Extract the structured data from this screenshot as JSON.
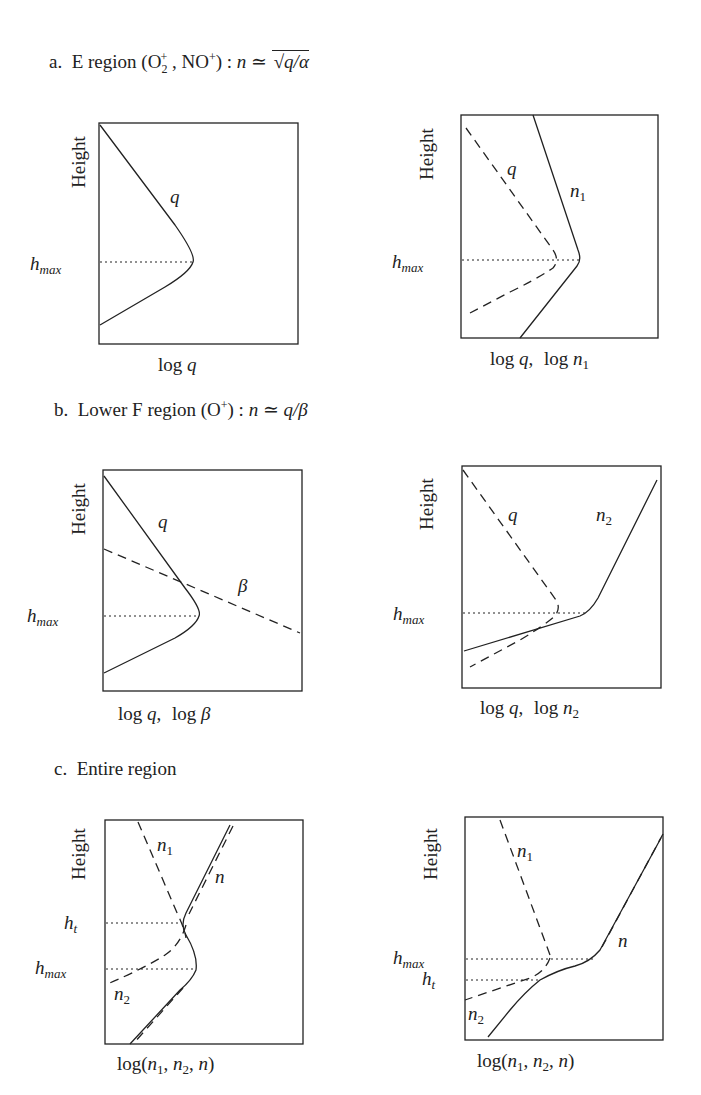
{
  "sections": [
    {
      "id": "a",
      "prefix": "a.",
      "title": "E region (O",
      "ion1_sub": "2",
      "ion1_sup": "+",
      "ion2": " , NO",
      "ion2_sup": "+",
      "formula_lead": ") : ",
      "formula_var": "n",
      "formula_rel": " ≃ ",
      "formula_rhs": "√(q/α)",
      "panels": [
        {
          "id": "a-left",
          "y_label": "Height",
          "x_label": "log q",
          "h_labels": [
            "h_max"
          ],
          "curve_labels": [
            "q"
          ]
        },
        {
          "id": "a-right",
          "y_label": "Height",
          "x_label": "log q,  log n1",
          "h_labels": [
            "h_max"
          ],
          "curve_labels": [
            "q",
            "n1"
          ]
        }
      ]
    },
    {
      "id": "b",
      "prefix": "b.",
      "title": "Lower F region (O",
      "ion1_sup": "+",
      "formula_lead": ") : ",
      "formula_var": "n",
      "formula_rel": " ≃ ",
      "formula_rhs": "q/β",
      "panels": [
        {
          "id": "b-left",
          "y_label": "Height",
          "x_label": "log q,  log β",
          "h_labels": [
            "h_max"
          ],
          "curve_labels": [
            "q",
            "β"
          ]
        },
        {
          "id": "b-right",
          "y_label": "Height",
          "x_label": "log q,  log n2",
          "h_labels": [
            "h_max"
          ],
          "curve_labels": [
            "q",
            "n2"
          ]
        }
      ]
    },
    {
      "id": "c",
      "prefix": "c.",
      "title": "Entire region",
      "panels": [
        {
          "id": "c-left",
          "y_label": "Height",
          "x_label": "log(n1, n2, n)",
          "h_labels": [
            "h_t",
            "h_max"
          ],
          "curve_labels": [
            "n1",
            "n",
            "n2"
          ]
        },
        {
          "id": "c-right",
          "y_label": "Height",
          "x_label": "log(n1, n2, n)",
          "h_labels": [
            "h_max",
            "h_t"
          ],
          "curve_labels": [
            "n1",
            "n",
            "n2"
          ]
        }
      ]
    }
  ],
  "text": {
    "height": "Height",
    "h": "h",
    "max": "max",
    "t": "t",
    "q": "q",
    "n": "n",
    "beta": "β",
    "one": "1",
    "two": "2",
    "log": "log",
    "comma": ",",
    "open_paren": "(",
    "close_paren": ")"
  },
  "colors": {
    "line": "#222222",
    "background": "#ffffff"
  }
}
